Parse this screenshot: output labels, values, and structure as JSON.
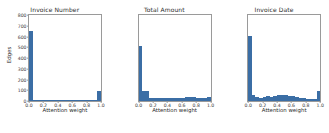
{
  "figure": {
    "xlabel": "Attention weight",
    "ylabel": "Edges",
    "bar_color": "#3b6ea5",
    "axis_color": "#9a9a9a"
  },
  "chart_data": {
    "type": "bar",
    "title": "",
    "xlabel": "Attention weight",
    "ylabel": "Edges",
    "xlim": [
      0.0,
      1.0
    ],
    "ylim": [
      0,
      800
    ],
    "grid": false,
    "legend": "none",
    "xticks": [
      "0.0",
      "0.2",
      "0.4",
      "0.6",
      "0.8",
      "1.0"
    ],
    "xtick_values": [
      0.0,
      0.2,
      0.4,
      0.6,
      0.8,
      1.0
    ],
    "yticks": [
      "0",
      "100",
      "200",
      "300",
      "400",
      "500",
      "600",
      "700",
      "800"
    ],
    "ytick_values": [
      0,
      100,
      200,
      300,
      400,
      500,
      600,
      700,
      800
    ],
    "bin_edges": [
      0.0,
      0.05,
      0.1,
      0.15,
      0.2,
      0.25,
      0.3,
      0.35,
      0.4,
      0.45,
      0.5,
      0.55,
      0.6,
      0.65,
      0.7,
      0.75,
      0.8,
      0.85,
      0.9,
      0.95,
      1.0
    ],
    "panels": [
      {
        "title": "Invoice Number",
        "show_yticks": true,
        "values": [
          645,
          10,
          6,
          5,
          5,
          6,
          8,
          9,
          10,
          9,
          8,
          7,
          6,
          6,
          5,
          5,
          5,
          6,
          8,
          95
        ]
      },
      {
        "title": "Total Amount",
        "show_yticks": false,
        "values": [
          505,
          92,
          92,
          32,
          30,
          28,
          26,
          25,
          24,
          24,
          26,
          30,
          32,
          34,
          36,
          34,
          32,
          30,
          28,
          38
        ]
      },
      {
        "title": "Invoice Date",
        "show_yticks": false,
        "values": [
          600,
          52,
          34,
          30,
          40,
          44,
          40,
          46,
          58,
          60,
          56,
          50,
          44,
          36,
          28,
          24,
          22,
          20,
          22,
          96
        ]
      }
    ]
  }
}
